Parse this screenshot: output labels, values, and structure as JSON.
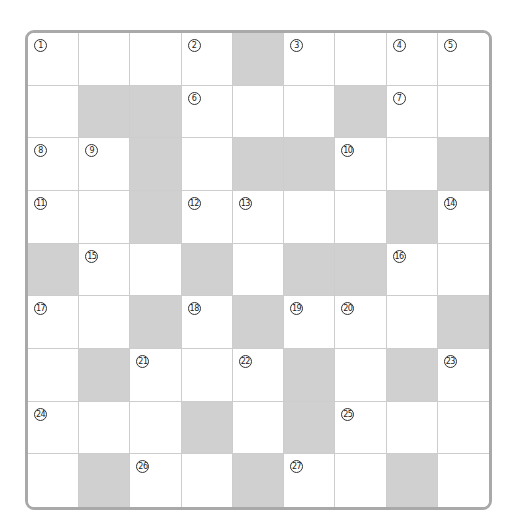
{
  "puzzle": {
    "type": "crossword",
    "rows": 9,
    "cols": 9,
    "colors": {
      "frame": "#a9a9a9",
      "gridline": "#cdcdcd",
      "blocked": "#d0d0d0",
      "open": "#ffffff",
      "number": "#222222"
    },
    "grid": [
      [
        {
          "n": "1"
        },
        {},
        {},
        {
          "n": "2"
        },
        {
          "b": true
        },
        {
          "n": "3"
        },
        {},
        {
          "n": "4"
        },
        {
          "n": "5"
        }
      ],
      [
        {},
        {
          "b": true
        },
        {
          "b": true
        },
        {
          "n": "6"
        },
        {},
        {},
        {
          "b": true
        },
        {
          "n": "7"
        },
        {}
      ],
      [
        {
          "n": "8"
        },
        {
          "n": "9"
        },
        {
          "b": true
        },
        {},
        {
          "b": true
        },
        {
          "b": true
        },
        {
          "n": "10"
        },
        {},
        {
          "b": true
        }
      ],
      [
        {
          "n": "11"
        },
        {},
        {
          "b": true
        },
        {
          "n": "12"
        },
        {
          "n": "13"
        },
        {},
        {},
        {
          "b": true
        },
        {
          "n": "14"
        }
      ],
      [
        {
          "b": true
        },
        {
          "n": "15"
        },
        {},
        {
          "b": true
        },
        {},
        {
          "b": true
        },
        {
          "b": true
        },
        {
          "n": "16"
        },
        {}
      ],
      [
        {
          "n": "17"
        },
        {},
        {
          "b": true
        },
        {
          "n": "18"
        },
        {
          "b": true
        },
        {
          "n": "19"
        },
        {
          "n": "20"
        },
        {},
        {
          "b": true
        }
      ],
      [
        {},
        {
          "b": true
        },
        {
          "n": "21"
        },
        {},
        {
          "n": "22"
        },
        {
          "b": true
        },
        {},
        {
          "b": true
        },
        {
          "n": "23"
        }
      ],
      [
        {
          "n": "24"
        },
        {},
        {},
        {
          "b": true
        },
        {},
        {
          "b": true
        },
        {
          "n": "25"
        },
        {},
        {}
      ],
      [
        {},
        {
          "b": true
        },
        {
          "n": "26"
        },
        {},
        {
          "b": true
        },
        {
          "n": "27"
        },
        {},
        {
          "b": true
        },
        {}
      ]
    ]
  }
}
